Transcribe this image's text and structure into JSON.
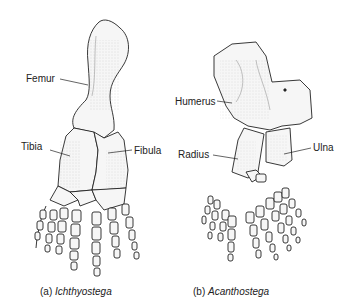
{
  "figure": {
    "panels": [
      {
        "id": "a",
        "caption_prefix": "(a)",
        "caption_taxon": "Ichthyostega",
        "labels": {
          "femur": "Femur",
          "tibia": "Tibia",
          "fibula": "Fibula"
        }
      },
      {
        "id": "b",
        "caption_prefix": "(b)",
        "caption_taxon": "Acanthostega",
        "labels": {
          "humerus": "Humerus",
          "radius": "Radius",
          "ulna": "Ulna"
        }
      }
    ],
    "colors": {
      "ink": "#222222",
      "bone_fill": "#f4f4f4",
      "shade": "#bbbbbb",
      "background": "#ffffff"
    }
  }
}
